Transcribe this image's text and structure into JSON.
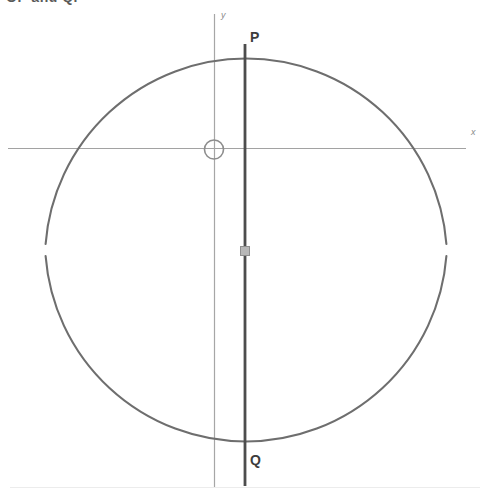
{
  "caption": {
    "text": "OP and Q.",
    "note": "clipped heading at top edge"
  },
  "figure": {
    "labels": {
      "point_p": "P",
      "point_q": "Q",
      "x_axis": "x",
      "y_axis": "y"
    },
    "colors": {
      "circle_stroke": "#6b6b6b",
      "chord_stroke": "#4a4a4a",
      "axis_stroke": "#9a9a9a",
      "origin_marker": "#8d8d8d",
      "handle_fill": "#b3b3b3",
      "handle_stroke": "#8a8a8a",
      "background": "#ffffff"
    },
    "geometry": {
      "circle": {
        "cx": 246,
        "cy": 250,
        "r": 201
      },
      "origin_marker": {
        "cx": 214,
        "cy": 149,
        "r": 10
      },
      "x_axis": {
        "x1": 8,
        "y1": 148,
        "x2": 466,
        "y2": 148
      },
      "y_axis": {
        "x": 214,
        "y1": 14,
        "y2": 487
      },
      "chord_pq": {
        "x": 245,
        "y1": 44,
        "y2": 486
      },
      "point_p": {
        "x": 245,
        "y": 48
      },
      "point_q": {
        "x": 245,
        "y": 452
      },
      "mid_handle": {
        "cx": 245,
        "cy": 251,
        "size": 9
      },
      "arc_handle_left": {
        "cx": 45,
        "cy": 249
      },
      "arc_handle_right": {
        "cx": 447,
        "cy": 249
      }
    }
  }
}
